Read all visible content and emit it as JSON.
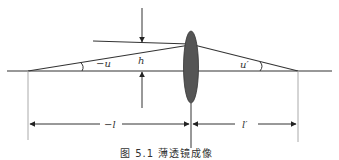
{
  "diagram": {
    "type": "thin-lens-imaging",
    "caption": "图 5.1  薄透镜成像",
    "labels": {
      "object_angle": "−u",
      "image_angle": "u′",
      "height": "h",
      "object_distance": "−l",
      "image_distance": "l′"
    },
    "colors": {
      "line": "#333333",
      "lens_fill": "#555555",
      "guide": "#aaaaaa",
      "background": "#ffffff"
    },
    "geometry": {
      "optical_axis_y": 71,
      "lens_x": 190,
      "object_point_x": 28,
      "image_point_x": 298,
      "ray_height_y": 43
    }
  }
}
